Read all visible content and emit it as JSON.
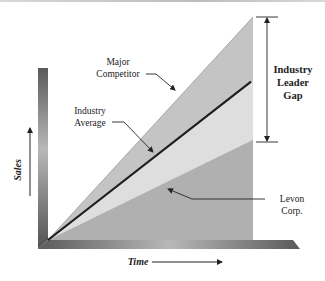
{
  "chart_data": {
    "type": "area",
    "title": "",
    "xlabel": "Time",
    "ylabel": "Sales",
    "x": [
      0,
      1
    ],
    "xlim": [
      0,
      1
    ],
    "ylim": [
      0,
      1
    ],
    "grid": false,
    "legend": "none",
    "series": [
      {
        "name": "Major Competitor",
        "values": [
          0,
          1.0
        ],
        "color": "#c4c4c4",
        "style": "filled-band"
      },
      {
        "name": "Industry Average",
        "values": [
          0,
          0.71
        ],
        "color": "#1e1e1e",
        "style": "line"
      },
      {
        "name": "Levon Corp.",
        "values": [
          0,
          0.45
        ],
        "color": "#b0b0b0",
        "style": "filled-area"
      }
    ],
    "middle_band_color": "#dedede",
    "annotations": [
      {
        "text": "Major Competitor",
        "lines": [
          "Major",
          "Competitor"
        ],
        "points_to": "Major Competitor"
      },
      {
        "text": "Industry Average",
        "lines": [
          "Industry",
          "Average"
        ],
        "points_to": "Industry Average"
      },
      {
        "text": "Levon Corp.",
        "lines": [
          "Levon",
          "Corp."
        ],
        "points_to": "Levon Corp."
      },
      {
        "text": "Industry Leader Gap",
        "lines": [
          "Industry",
          "Leader",
          "Gap"
        ],
        "spans": [
          "Levon Corp.",
          "Major Competitor"
        ]
      }
    ]
  },
  "labels": {
    "x_axis": "Time",
    "y_axis": "Sales",
    "major_competitor": [
      "Major",
      "Competitor"
    ],
    "industry_average": [
      "Industry",
      "Average"
    ],
    "levon": [
      "Levon",
      "Corp."
    ],
    "gap": [
      "Industry",
      "Leader",
      "Gap"
    ]
  }
}
